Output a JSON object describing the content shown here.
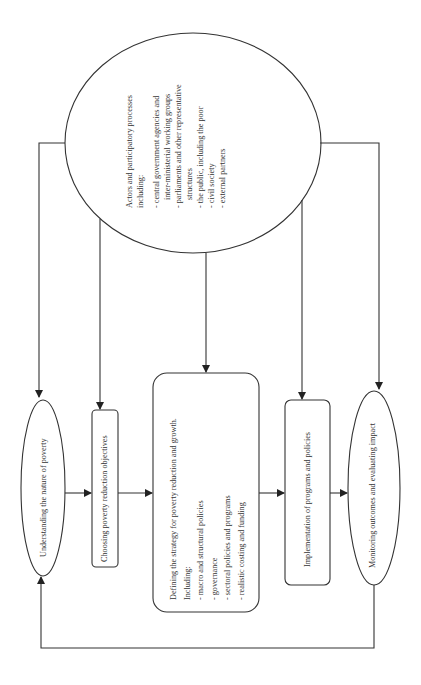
{
  "diagram": {
    "orientation": "rotated 90 degrees (text reads bottom-to-top)",
    "actors": {
      "title_lines": [
        "Actors and participatory processes",
        "including:"
      ],
      "items": [
        [
          "- central government agencies and",
          "inter-ministerial working groups"
        ],
        [
          "- parliaments and other representative",
          "structures"
        ],
        [
          "- the public, including the poor"
        ],
        [
          "- civil society"
        ],
        [
          "- external partners"
        ]
      ]
    },
    "steps": [
      {
        "id": "understanding",
        "shape": "ellipse",
        "label": "Understanding the nature of poverty"
      },
      {
        "id": "choosing",
        "shape": "rounded-rect",
        "label": "Choosing poverty reduction objectives"
      },
      {
        "id": "defining",
        "shape": "rounded-rect",
        "label": "Defining the strategy for poverty reduction and growth.",
        "sub_title": "Including:",
        "items": [
          "- macro and structural policies",
          "- governance",
          "- sectoral policies and programs",
          "- realistic costing and funding"
        ]
      },
      {
        "id": "implementation",
        "shape": "rounded-rect",
        "label": "Implementation of programs and policies"
      },
      {
        "id": "monitoring",
        "shape": "ellipse",
        "label": "Monitoring outcomes and evaluating impact"
      }
    ],
    "connections": [
      "actors -> understanding",
      "actors -> choosing",
      "actors -> defining",
      "actors -> implementation",
      "actors -> monitoring",
      "understanding -> choosing",
      "choosing -> defining",
      "defining -> implementation",
      "implementation -> monitoring",
      "monitoring -> understanding (feedback loop)"
    ]
  }
}
